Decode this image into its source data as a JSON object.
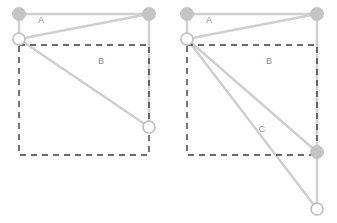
{
  "figure": {
    "width": 337,
    "height": 223,
    "background": "#ffffff",
    "edge_color": "#cfcfcf",
    "node_fill_filled": "#c4c4c4",
    "node_fill_open": "#ffffff",
    "node_stroke": "#bdbdbd",
    "dashed_color": "#3a3a3a",
    "label_color": "#8d8d8d"
  },
  "panels": [
    {
      "id": "left-panel",
      "name": "panel-left",
      "labels": [
        {
          "text": "A",
          "x": 41,
          "y": 21
        },
        {
          "text": "B",
          "x": 101,
          "y": 62
        }
      ],
      "nodes": [
        {
          "id": "n-top-left",
          "x": 19,
          "y": 14,
          "r": 6.5,
          "style": "filled"
        },
        {
          "id": "n-top-right",
          "x": 149,
          "y": 14,
          "r": 6.5,
          "style": "filled"
        },
        {
          "id": "n-hinge-left",
          "x": 19,
          "y": 39,
          "r": 6.0,
          "style": "open"
        },
        {
          "id": "n-bottom-right",
          "x": 149,
          "y": 127,
          "r": 6.0,
          "style": "open"
        }
      ],
      "edges": [
        {
          "from": "n-top-left",
          "to": "n-top-right"
        },
        {
          "from": "n-top-left",
          "to": "n-hinge-left"
        },
        {
          "from": "n-hinge-left",
          "to": "n-top-right"
        },
        {
          "from": "n-hinge-left",
          "to": "n-bottom-right"
        },
        {
          "from": "n-top-right",
          "to": "n-bottom-right"
        }
      ],
      "dashed_rect": {
        "x": 19,
        "y": 45,
        "width": 130,
        "height": 110
      }
    },
    {
      "id": "right-panel",
      "name": "panel-right",
      "labels": [
        {
          "text": "A",
          "x": 41,
          "y": 21
        },
        {
          "text": "B",
          "x": 101,
          "y": 62
        },
        {
          "text": "C",
          "x": 94,
          "y": 130
        }
      ],
      "nodes": [
        {
          "id": "n-top-left",
          "x": 19,
          "y": 14,
          "r": 6.5,
          "style": "filled"
        },
        {
          "id": "n-top-right",
          "x": 149,
          "y": 14,
          "r": 6.5,
          "style": "filled"
        },
        {
          "id": "n-hinge-left",
          "x": 19,
          "y": 39,
          "r": 6.0,
          "style": "open"
        },
        {
          "id": "n-mid-right",
          "x": 149,
          "y": 152,
          "r": 6.5,
          "style": "filled"
        },
        {
          "id": "n-bottom-right",
          "x": 149,
          "y": 209,
          "r": 6.0,
          "style": "open"
        }
      ],
      "edges": [
        {
          "from": "n-top-left",
          "to": "n-top-right"
        },
        {
          "from": "n-top-left",
          "to": "n-hinge-left"
        },
        {
          "from": "n-hinge-left",
          "to": "n-top-right"
        },
        {
          "from": "n-hinge-left",
          "to": "n-mid-right"
        },
        {
          "from": "n-hinge-left",
          "to": "n-bottom-right"
        },
        {
          "from": "n-top-right",
          "to": "n-mid-right"
        },
        {
          "from": "n-mid-right",
          "to": "n-bottom-right"
        }
      ],
      "dashed_rect": {
        "x": 19,
        "y": 45,
        "width": 130,
        "height": 110
      }
    }
  ]
}
